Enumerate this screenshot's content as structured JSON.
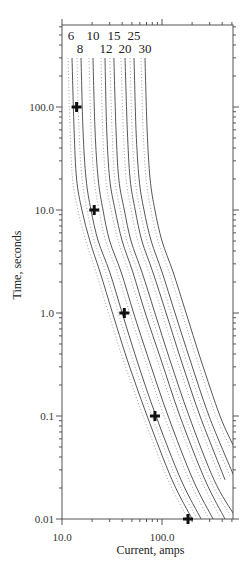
{
  "chart_data": {
    "type": "line",
    "title": "",
    "xlabel": "Current, amps",
    "ylabel": "Time, seconds",
    "xscale": "log",
    "yscale": "log",
    "xlim": [
      10,
      525
    ],
    "ylim": [
      0.01,
      625
    ],
    "x_tick_labels": [
      "10.0",
      "100.0"
    ],
    "y_tick_labels": [
      "0.01",
      "0.1",
      "1.0",
      "10.0",
      "100.0"
    ],
    "grid": false,
    "legend": "curve labels at top",
    "curve_labels_row1": [
      "6",
      "10",
      "15",
      "25"
    ],
    "curve_labels_row2": [
      "8",
      "12",
      "20",
      "30"
    ],
    "series": [
      {
        "name": "6",
        "style": "solid with dotted tolerance band",
        "points": [
          [
            12.6,
            500
          ],
          [
            12.6,
            150
          ],
          [
            13.2,
            60
          ],
          [
            14,
            20
          ],
          [
            15.8,
            10
          ],
          [
            19,
            5
          ],
          [
            24,
            2.5
          ],
          [
            32,
            1
          ],
          [
            45,
            0.35
          ],
          [
            71,
            0.1
          ],
          [
            126,
            0.024
          ],
          [
            200,
            0.01
          ]
        ]
      },
      {
        "name": "8",
        "style": "solid with dotted tolerance band",
        "points": [
          [
            15.5,
            500
          ],
          [
            15.5,
            150
          ],
          [
            16.2,
            60
          ],
          [
            17.4,
            20
          ],
          [
            19.5,
            10
          ],
          [
            23,
            5
          ],
          [
            30,
            2.5
          ],
          [
            40,
            1
          ],
          [
            56,
            0.35
          ],
          [
            87,
            0.1
          ],
          [
            155,
            0.024
          ],
          [
            246,
            0.01
          ]
        ]
      },
      {
        "name": "10",
        "style": "solid with dotted tolerance band",
        "points": [
          [
            20.4,
            500
          ],
          [
            20.4,
            150
          ],
          [
            21.4,
            60
          ],
          [
            23,
            20
          ],
          [
            25.7,
            10
          ],
          [
            30,
            5
          ],
          [
            39,
            2.5
          ],
          [
            52,
            1
          ],
          [
            74,
            0.35
          ],
          [
            115,
            0.1
          ],
          [
            204,
            0.024
          ],
          [
            324,
            0.01
          ]
        ]
      },
      {
        "name": "12",
        "style": "solid with dotted tolerance band",
        "points": [
          [
            26.9,
            500
          ],
          [
            26.9,
            150
          ],
          [
            28,
            60
          ],
          [
            30,
            20
          ],
          [
            34,
            10
          ],
          [
            40,
            5
          ],
          [
            51,
            2.5
          ],
          [
            68,
            1
          ],
          [
            98,
            0.35
          ],
          [
            151,
            0.1
          ],
          [
            269,
            0.024
          ],
          [
            427,
            0.01
          ]
        ]
      },
      {
        "name": "15",
        "style": "solid with dotted tolerance band",
        "points": [
          [
            33,
            500
          ],
          [
            33,
            150
          ],
          [
            34.7,
            60
          ],
          [
            37,
            20
          ],
          [
            42,
            10
          ],
          [
            49,
            5
          ],
          [
            63,
            2.5
          ],
          [
            85,
            1
          ],
          [
            120,
            0.35
          ],
          [
            186,
            0.1
          ],
          [
            331,
            0.024
          ],
          [
            525,
            0.011
          ]
        ]
      },
      {
        "name": "20",
        "style": "solid with dotted tolerance band",
        "points": [
          [
            42.7,
            500
          ],
          [
            42.7,
            150
          ],
          [
            45,
            60
          ],
          [
            48,
            20
          ],
          [
            54,
            10
          ],
          [
            63,
            5
          ],
          [
            81,
            2.5
          ],
          [
            110,
            1
          ],
          [
            155,
            0.35
          ],
          [
            240,
            0.1
          ],
          [
            427,
            0.024
          ]
        ]
      },
      {
        "name": "25",
        "style": "solid with dotted tolerance band",
        "points": [
          [
            52.5,
            500
          ],
          [
            52.5,
            150
          ],
          [
            55,
            60
          ],
          [
            59,
            20
          ],
          [
            66,
            10
          ],
          [
            78,
            5
          ],
          [
            100,
            2.5
          ],
          [
            135,
            1
          ],
          [
            191,
            0.35
          ],
          [
            295,
            0.1
          ],
          [
            525,
            0.026
          ]
        ]
      },
      {
        "name": "30",
        "style": "solid with dotted tolerance band",
        "points": [
          [
            67.6,
            500
          ],
          [
            67.6,
            150
          ],
          [
            71,
            60
          ],
          [
            76,
            20
          ],
          [
            85,
            10
          ],
          [
            100,
            5
          ],
          [
            129,
            2.5
          ],
          [
            174,
            1
          ],
          [
            245,
            0.35
          ],
          [
            380,
            0.1
          ],
          [
            525,
            0.05
          ]
        ]
      }
    ],
    "markers": {
      "symbol": "plus",
      "points": [
        [
          14,
          100
        ],
        [
          21,
          10
        ],
        [
          42,
          1
        ],
        [
          85,
          0.1
        ],
        [
          182,
          0.01
        ]
      ]
    }
  }
}
